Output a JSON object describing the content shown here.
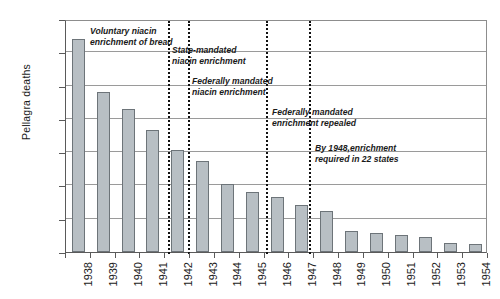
{
  "chart_data": {
    "type": "bar",
    "title": "",
    "xlabel": "",
    "ylabel": "Pellagra deaths",
    "ylim": [
      0,
      3500
    ],
    "ytick_step": 500,
    "yticks": [
      0,
      500,
      1000,
      1500,
      2000,
      2500,
      3000,
      3500
    ],
    "grid": true,
    "legend": "none",
    "categories": [
      "1938",
      "1939",
      "1940",
      "1941",
      "1942",
      "1943",
      "1944",
      "1945",
      "1946",
      "1947",
      "1948",
      "1949",
      "1950",
      "1951",
      "1952",
      "1953",
      "1954"
    ],
    "values": [
      3200,
      2400,
      2150,
      1840,
      1530,
      1360,
      1020,
      900,
      820,
      700,
      620,
      320,
      280,
      255,
      230,
      135,
      120
    ],
    "bar_color": "#b8bfc4",
    "bar_border_color": "#6d7479",
    "annotations": [
      {
        "id": "voluntary-niacin",
        "text": "Voluntary niacin\nenrichment of bread",
        "marker_year": "1942",
        "marker_x": 167,
        "text_x": 89,
        "text_y": 25
      },
      {
        "id": "state-mandated",
        "text": "State-mandated\nniacin enrichment",
        "marker_year": "1942",
        "marker_x": 187,
        "text_x": 171,
        "text_y": 44
      },
      {
        "id": "federally-mandated",
        "text": "Federally mandated\nniacin enrichment",
        "marker_year": "1943",
        "marker_x": 187,
        "text_x": 191,
        "text_y": 75
      },
      {
        "id": "enrichment-repealed",
        "text": "Federally mandated\nenrichment repealed",
        "marker_year": "1946",
        "marker_x": 265,
        "text_x": 271,
        "text_y": 106
      },
      {
        "id": "by-1948-22-states",
        "text": "By 1948,enrichment\nrequired in 22 states",
        "marker_year": "1948",
        "marker_x": 308,
        "text_x": 314,
        "text_y": 142
      }
    ],
    "event_lines": [
      {
        "id": "event-line-1942a",
        "x": 167
      },
      {
        "id": "event-line-1942b",
        "x": 187
      },
      {
        "id": "event-line-1946",
        "x": 265
      },
      {
        "id": "event-line-1948",
        "x": 308
      }
    ]
  }
}
